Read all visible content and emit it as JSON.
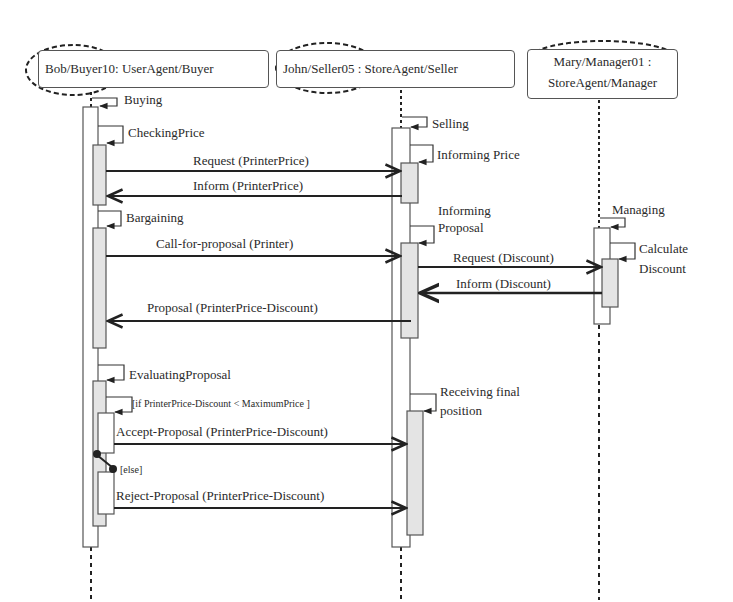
{
  "diagram": {
    "type": "sequence",
    "participants": [
      {
        "id": "buyer",
        "instance": "Bob/Buyer10",
        "classifier": "UserAgent/Buyer",
        "header_label": "Bob/Buyer10: UserAgent/Buyer"
      },
      {
        "id": "seller",
        "instance": "John/Seller05",
        "classifier": "StoreAgent/Seller",
        "header_label": "John/Seller05 : StoreAgent/Seller"
      },
      {
        "id": "manager",
        "instance": "Mary/Manager01 :",
        "classifier": "StoreAgent/Manager"
      }
    ],
    "self_calls": {
      "buying": "Buying",
      "checking_price": "CheckingPrice",
      "bargaining": "Bargaining",
      "evaluating_proposal": "EvaluatingProposal",
      "selling": "Selling",
      "informing_price": "Informing Price",
      "informing_proposal_1": "Informing",
      "informing_proposal_2": "Proposal",
      "receiving_final_1": "Receiving final",
      "receiving_final_2": "position",
      "managing": "Managing",
      "calculate_discount_1": "Calculate",
      "calculate_discount_2": "Discount"
    },
    "messages": [
      {
        "from": "buyer",
        "to": "seller",
        "label": "Request (PrinterPrice)"
      },
      {
        "from": "seller",
        "to": "buyer",
        "label": "Inform (PrinterPrice)"
      },
      {
        "from": "buyer",
        "to": "seller",
        "label": "Call-for-proposal (Printer)"
      },
      {
        "from": "seller",
        "to": "manager",
        "label": "Request (Discount)"
      },
      {
        "from": "manager",
        "to": "seller",
        "label": "Inform (Discount)"
      },
      {
        "from": "seller",
        "to": "buyer",
        "label": "Proposal (PrinterPrice-Discount)"
      },
      {
        "from": "buyer",
        "to": "seller",
        "label": "Accept-Proposal (PrinterPrice-Discount)"
      },
      {
        "from": "buyer",
        "to": "seller",
        "label": "Reject-Proposal (PrinterPrice-Discount)"
      }
    ],
    "guards": {
      "if_guard": "[if PrinterPrice-Discount < MaximumPrice ]",
      "else_guard": "[else]"
    }
  }
}
